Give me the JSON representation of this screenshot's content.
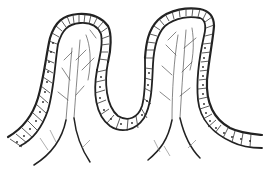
{
  "figure": {
    "background": "#ffffff",
    "stroke_color": "#2a2a2a",
    "faint_stroke_color": "#6a6a6a",
    "villi_count": 2,
    "labels": []
  }
}
